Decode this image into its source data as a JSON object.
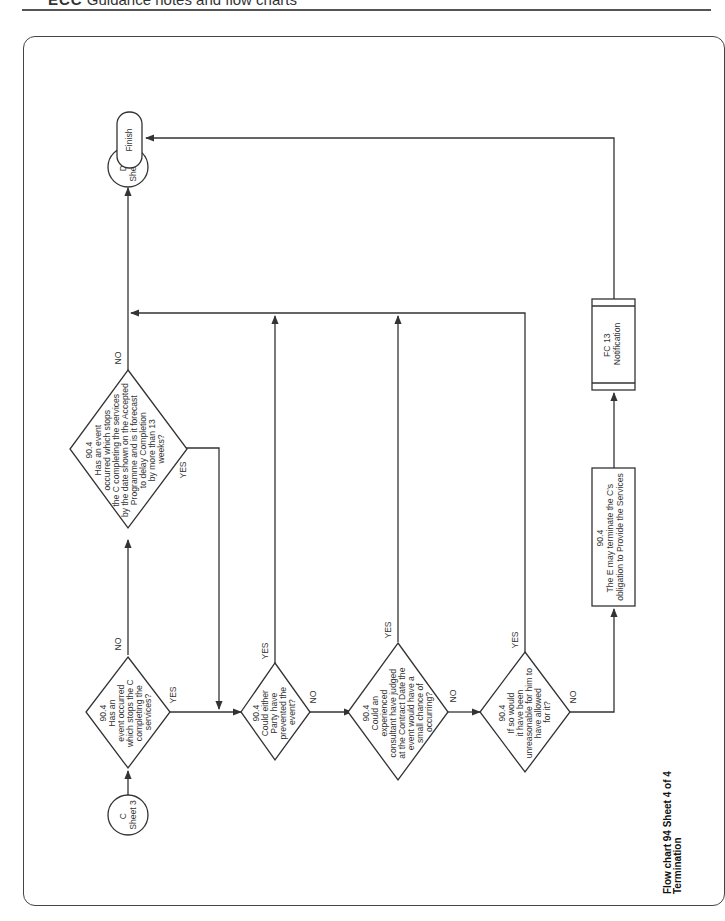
{
  "header": {
    "prefix": "ECC",
    "text": "Guidance notes and flow charts"
  },
  "chart_title": {
    "line1": "Flow chart 94 Sheet 4 of 4",
    "line2": "Termination"
  },
  "nodes": {
    "start_connector": {
      "line1": "C",
      "line2": "Sheet 3"
    },
    "end_connector": {
      "line1": "D",
      "line2": "Sheet 3"
    },
    "finish": {
      "label": "Finish"
    },
    "d1": {
      "lines": [
        "90.4",
        "Has an",
        "event occurred",
        "which stops the C",
        "completing the",
        "services?"
      ]
    },
    "d2": {
      "lines": [
        "90.4",
        "Has an event",
        "occurred which stops",
        "the C completing the services",
        "by the date shown on the Accepted",
        "Programme and is it forecast",
        "to delay Completion",
        "by more than 13",
        "weeks?"
      ]
    },
    "d3": {
      "lines": [
        "90.4",
        "Could either",
        "Party have",
        "prevented the",
        "event?"
      ]
    },
    "d4": {
      "lines": [
        "90.4",
        "Could an",
        "experienced",
        "consultant have judged",
        "at the Contract Date the",
        "event would have a",
        "small chance of",
        "occurring?"
      ]
    },
    "d5": {
      "lines": [
        "90.4",
        "If so would",
        "it have been",
        "unreasonable for him to",
        "have allowed",
        "for it?"
      ]
    },
    "action": {
      "lines": [
        "90.4",
        "The E may terminate the C's",
        "obligation to Provide the Services"
      ]
    },
    "subprocess": {
      "lines": [
        "FC 13",
        "Notification"
      ]
    }
  },
  "edge_labels": {
    "yes": "YES",
    "no": "NO"
  },
  "colors": {
    "line": "#333333",
    "background": "#ffffff"
  }
}
